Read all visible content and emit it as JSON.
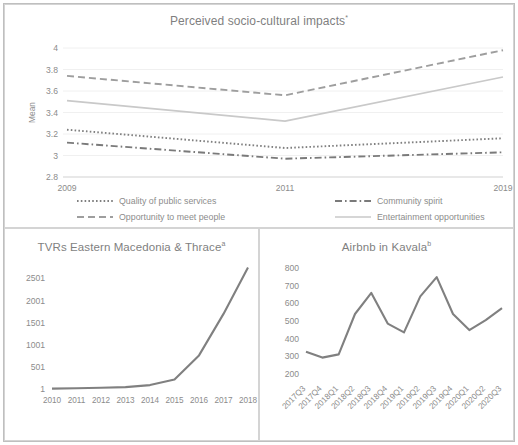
{
  "figure": {
    "panels": [
      "perceived-impacts",
      "tvrs-eastern-macedonia-thrace",
      "airbnb-kavala"
    ]
  },
  "chart_data": [
    {
      "id": "perceived-impacts",
      "type": "line",
      "title": "Perceived socio-cultural impacts",
      "title_superscript": "*",
      "xlabel": "",
      "ylabel": "Mean",
      "categories": [
        "2009",
        "2011",
        "2019"
      ],
      "x_ticks": [
        "2009",
        "2011",
        "2019"
      ],
      "y_ticks": [
        "2.8",
        "3",
        "3.2",
        "3.4",
        "3.6",
        "3.8",
        "4"
      ],
      "ylim": [
        2.8,
        4.0
      ],
      "grid": true,
      "legend_position": "bottom",
      "series": [
        {
          "name": "Quality of public services",
          "style": "dotted",
          "color": "#808080",
          "values": [
            3.24,
            3.07,
            3.16
          ]
        },
        {
          "name": "Community spirit",
          "style": "dashdot",
          "color": "#7a7a7a",
          "values": [
            3.12,
            2.97,
            3.03
          ]
        },
        {
          "name": "Opportunity to meet people",
          "style": "dashed",
          "color": "#9e9e9e",
          "values": [
            3.74,
            3.56,
            3.98
          ]
        },
        {
          "name": "Entertainment opportunities",
          "style": "solid",
          "color": "#c9c9c9",
          "values": [
            3.51,
            3.32,
            3.73
          ]
        }
      ]
    },
    {
      "id": "tvrs-eastern-macedonia-thrace",
      "type": "line",
      "title": "TVRs Eastern Macedonia & Thrace",
      "title_superscript": "a",
      "xlabel": "",
      "ylabel": "",
      "categories": [
        "2010",
        "2011",
        "2012",
        "2013",
        "2014",
        "2015",
        "2016",
        "2017",
        "2018"
      ],
      "x_ticks": [
        "2010",
        "2011",
        "2012",
        "2013",
        "2014",
        "2015",
        "2016",
        "2017",
        "2018"
      ],
      "y_ticks": [
        "1",
        "501",
        "1001",
        "1501",
        "2001",
        "2501"
      ],
      "ylim": [
        1,
        2760
      ],
      "grid": false,
      "series": [
        {
          "name": "TVRs",
          "style": "solid",
          "color": "#808080",
          "values": [
            10,
            20,
            30,
            45,
            90,
            215,
            760,
            1700,
            2750
          ]
        }
      ]
    },
    {
      "id": "airbnb-kavala",
      "type": "line",
      "title": "Airbnb in Kavala",
      "title_superscript": "b",
      "xlabel": "",
      "ylabel": "",
      "categories": [
        "2017Q3",
        "2017Q4",
        "2018Q1",
        "2018Q2",
        "2018Q3",
        "2018Q4",
        "2019Q1",
        "2019Q2",
        "2019Q3",
        "2019Q4",
        "2020Q1",
        "2020Q2",
        "2020Q3"
      ],
      "x_ticks": [
        "2017Q3",
        "2017Q4",
        "2018Q1",
        "2018Q2",
        "2018Q3",
        "2018Q4",
        "2019Q1",
        "2019Q2",
        "2019Q3",
        "2019Q4",
        "2020Q1",
        "2020Q2",
        "2020Q3"
      ],
      "y_ticks": [
        "200",
        "300",
        "400",
        "500",
        "600",
        "700",
        "800"
      ],
      "ylim": [
        170,
        830
      ],
      "grid": false,
      "series": [
        {
          "name": "Airbnb listings",
          "style": "solid",
          "color": "#808080",
          "values": [
            325,
            292,
            310,
            540,
            660,
            485,
            435,
            640,
            750,
            540,
            448,
            505,
            573
          ]
        }
      ]
    }
  ]
}
